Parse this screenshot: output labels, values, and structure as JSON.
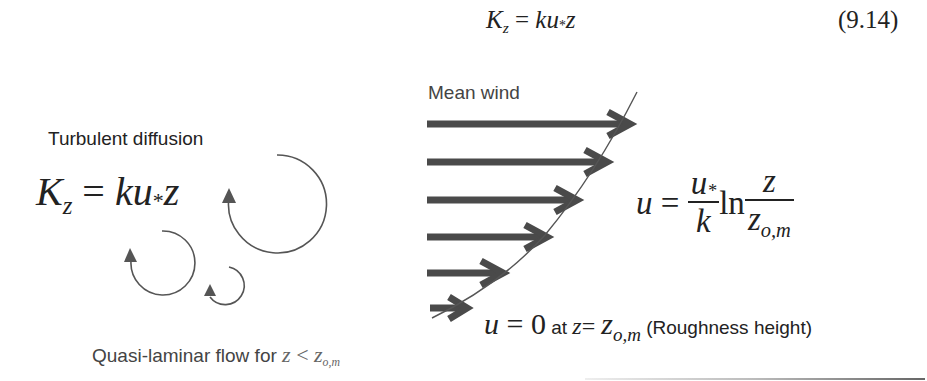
{
  "equation_header": {
    "lhs": "K",
    "lhs_sub": "z",
    "equals": "=",
    "rhs_k": "ku",
    "rhs_star": "*",
    "rhs_z": "z",
    "number": "(9.14)"
  },
  "left_panel": {
    "title": "Turbulent diffusion",
    "equation": {
      "lhs": "K",
      "lhs_sub": "z",
      "equals": " = ",
      "rhs_k": "ku",
      "rhs_star": "*",
      "rhs_z": "z"
    },
    "eddies": [
      {
        "name": "large-eddy",
        "cx": 277,
        "cy": 209,
        "r": 49
      },
      {
        "name": "medium-eddy",
        "cx": 163,
        "cy": 264,
        "r": 32
      },
      {
        "name": "small-eddy",
        "cx": 229,
        "cy": 297,
        "r": 19
      }
    ],
    "bottom_label": {
      "text": "Quasi-laminar flow for ",
      "math_z": "z",
      "math_lt": " < ",
      "math_z0": "z",
      "math_sub": "o,m"
    }
  },
  "right_panel": {
    "title": "Mean wind",
    "arrows": [
      {
        "y": 124,
        "x_end": 635
      },
      {
        "y": 162,
        "x_end": 612
      },
      {
        "y": 200,
        "x_end": 582
      },
      {
        "y": 237,
        "x_end": 552
      },
      {
        "y": 273,
        "x_end": 508
      },
      {
        "y": 308,
        "x_end": 470
      }
    ],
    "log_law": {
      "lhs": "u",
      "equals": " = ",
      "frac1_num": "u",
      "frac1_num_star": "*",
      "frac1_den": "k",
      "ln": "ln",
      "frac2_num": "z",
      "frac2_den": "z",
      "frac2_den_sub": "o,m"
    },
    "boundary_condition": {
      "u": "u",
      "eq_zero": " = 0",
      "at": " at ",
      "z": "z",
      "eq": "= ",
      "z0": "z",
      "z0_sub": "o,m",
      "note": " (Roughness height)"
    }
  },
  "colors": {
    "text": "#222222",
    "label_gray": "#444444",
    "arrow": "#4a4a4a",
    "curve": "#555555"
  }
}
